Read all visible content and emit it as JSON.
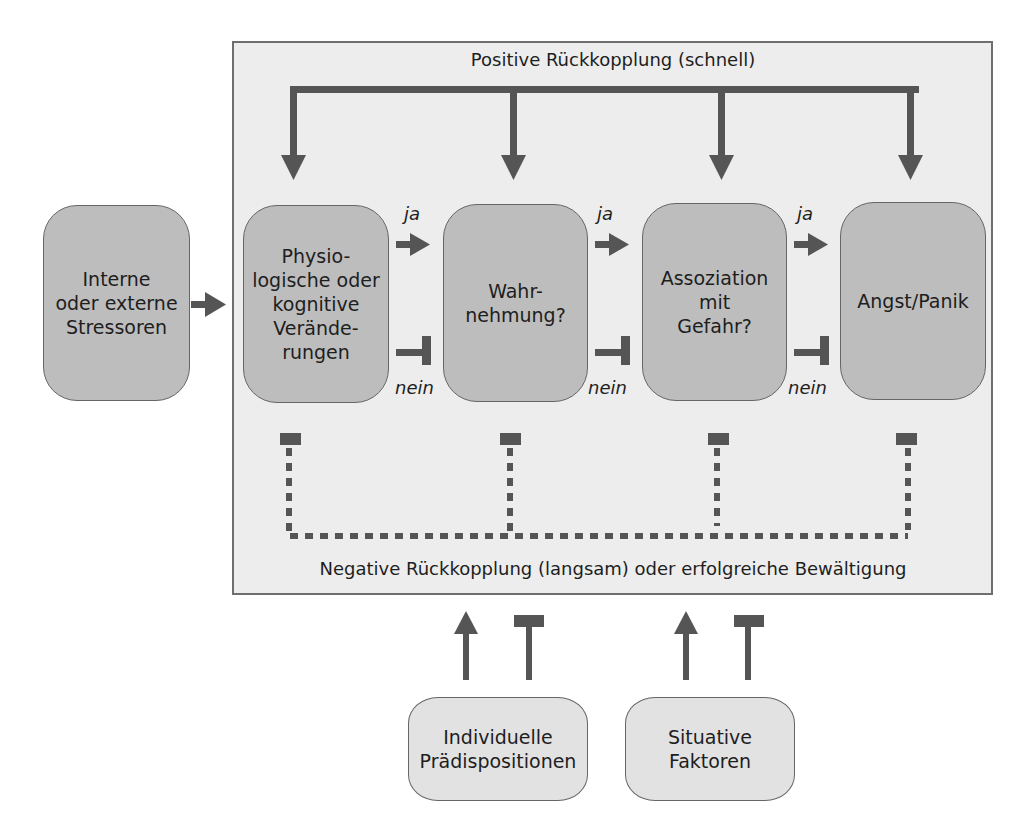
{
  "diagram": {
    "title_top": "Positive Rückkopplung (schnell)",
    "title_bottom": "Negative Rückkopplung (langsam) oder erfolgreiche Bewältigung",
    "external_input": {
      "label": "Interne\noder externe\nStressoren"
    },
    "stages": [
      {
        "label": "Physio-\nlogische oder\nkognitive\nVerände-\nrungen"
      },
      {
        "label": "Wahr-\nnehmung?"
      },
      {
        "label": "Assoziation\nmit\nGefahr?"
      },
      {
        "label": "Angst/Panik"
      }
    ],
    "transitions": [
      {
        "yes": "ja",
        "no": "nein"
      },
      {
        "yes": "ja",
        "no": "nein"
      },
      {
        "yes": "ja",
        "no": "nein"
      }
    ],
    "modulators": [
      {
        "label": "Individuelle\nPrädispositionen"
      },
      {
        "label": "Situative\nFaktoren"
      }
    ],
    "colors": {
      "panel_bg": "#ededed",
      "panel_border": "#6e6e6e",
      "stage_fill": "#bdbdbd",
      "modulator_fill": "#e2e2e2",
      "arrow": "#555555"
    }
  }
}
